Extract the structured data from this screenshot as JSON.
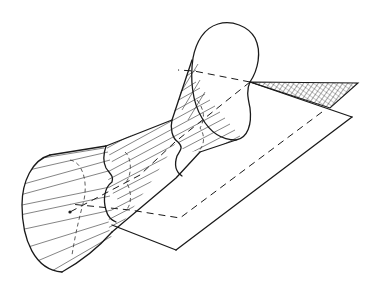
{
  "figure": {
    "type": "line-art technical illustration",
    "colors": {
      "background": "#ffffff",
      "ink": "#1a1a1a"
    },
    "elements": [
      {
        "name": "conical-mouth",
        "description": "wide funnel opening at lower left with ruling lines"
      },
      {
        "name": "tube-body",
        "description": "ruled cylindrical mid-section with scalloped (bi-lobed) cross-section"
      },
      {
        "name": "cardioid-opening",
        "description": "heart-shaped opening at upper right"
      },
      {
        "name": "plane",
        "description": "parallelogram plane beneath the surface, partly hidden (dashed)"
      },
      {
        "name": "hatched-triangle",
        "description": "cross-hatched triangular patch of plane visible beyond the cusp"
      }
    ],
    "labels": []
  }
}
